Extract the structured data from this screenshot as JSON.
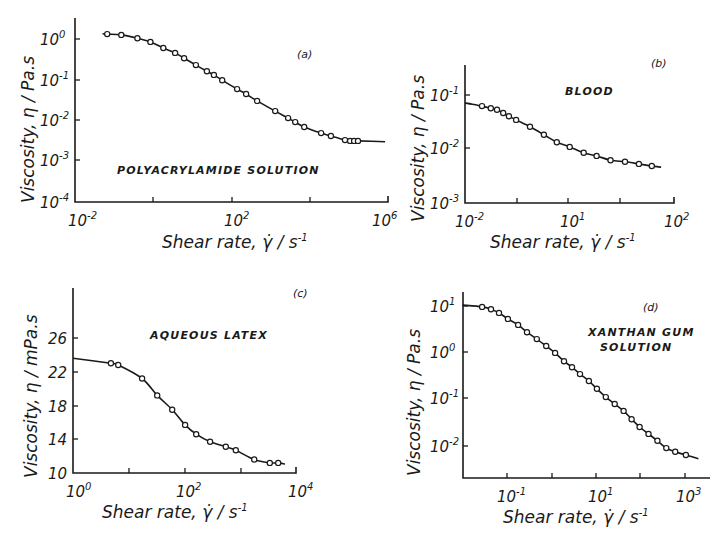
{
  "figure": {
    "panels": [
      {
        "id": "a",
        "tag": "(a)",
        "annotation": [
          "POLYACRYLAMIDE SOLUTION"
        ],
        "xlabel": "Shear rate, γ̇ / s⁻¹",
        "ylabel": "Viscosity, η / Pa.s"
      },
      {
        "id": "b",
        "tag": "(b)",
        "annotation": [
          "BLOOD"
        ],
        "xlabel": "Shear rate, γ̇ / s⁻¹",
        "ylabel": "Viscosity, η / Pa.s"
      },
      {
        "id": "c",
        "tag": "(c)",
        "annotation": [
          "AQUEOUS LATEX"
        ],
        "xlabel": "Shear rate, γ̇ / s⁻¹",
        "ylabel": "Viscosity, η / mPa.s"
      },
      {
        "id": "d",
        "tag": "(d)",
        "annotation": [
          "XANTHAN GUM",
          "SOLUTION"
        ],
        "xlabel": "Shear rate, γ̇ / s⁻¹",
        "ylabel": "Viscosity, η / Pa.s"
      }
    ]
  },
  "chart_data": [
    {
      "id": "a",
      "type": "line",
      "title": "(a) POLYACRYLAMIDE SOLUTION",
      "xlabel": "Shear rate, γ̇ / s⁻¹",
      "ylabel": "Viscosity, η / Pa.s",
      "xscale": "log",
      "yscale": "log",
      "xlim": [
        0.01,
        1000000
      ],
      "ylim": [
        0.0001,
        3
      ],
      "xticks": [
        "10^-2",
        "10^2",
        "10^6"
      ],
      "yticks": [
        "10^0",
        "10^-1",
        "10^-2",
        "10^-3",
        "10^-4"
      ],
      "x_log10": [
        -1.18,
        -0.82,
        -0.41,
        -0.08,
        0.25,
        0.55,
        0.78,
        1.08,
        1.36,
        1.54,
        1.75,
        2.13,
        2.36,
        2.64,
        3.1,
        3.43,
        3.61,
        3.84,
        4.27,
        4.52,
        4.88,
        5.01,
        5.11,
        5.21
      ],
      "y_log10": [
        0.12,
        0.1,
        0.02,
        -0.07,
        -0.22,
        -0.34,
        -0.47,
        -0.64,
        -0.79,
        -0.88,
        -1.01,
        -1.23,
        -1.35,
        -1.52,
        -1.77,
        -1.94,
        -2.04,
        -2.16,
        -2.31,
        -2.38,
        -2.48,
        -2.5,
        -2.5,
        -2.5
      ],
      "series": [
        {
          "name": "measured",
          "marker": "open-circle"
        },
        {
          "name": "fit",
          "style": "solid-line"
        }
      ]
    },
    {
      "id": "b",
      "type": "line",
      "title": "(b) BLOOD",
      "xlabel": "Shear rate, γ̇ / s⁻¹",
      "ylabel": "Viscosity, η / Pa.s",
      "xscale": "log",
      "yscale": "log",
      "xlim": [
        0.01,
        100
      ],
      "ylim": [
        0.001,
        0.3
      ],
      "xticks": [
        "10^-2",
        "10^1",
        "10^2"
      ],
      "yticks": [
        "10^-1",
        "10^-2",
        "10^-3"
      ],
      "x_log10": [
        -1.67,
        -1.5,
        -1.38,
        -1.26,
        -1.15,
        -1.01,
        -0.74,
        -0.47,
        -0.22,
        0.03,
        0.3,
        0.55,
        0.82,
        1.1,
        1.37,
        1.62
      ],
      "y_log10": [
        -1.21,
        -1.25,
        -1.28,
        -1.34,
        -1.4,
        -1.47,
        -1.6,
        -1.75,
        -1.89,
        -1.98,
        -2.09,
        -2.15,
        -2.23,
        -2.26,
        -2.3,
        -2.34
      ],
      "series": [
        {
          "name": "measured",
          "marker": "open-circle"
        },
        {
          "name": "fit",
          "style": "solid-line"
        }
      ]
    },
    {
      "id": "c",
      "type": "line",
      "title": "(c) AQUEOUS LATEX",
      "xlabel": "Shear rate, γ̇ / s⁻¹",
      "ylabel": "Viscosity, η / mPa.s",
      "xscale": "log",
      "yscale": "linear",
      "xlim": [
        1,
        10000
      ],
      "ylim": [
        10,
        30
      ],
      "xticks": [
        "10^0",
        "10^2",
        "10^4"
      ],
      "yticks": [
        "26",
        "22",
        "18",
        "14",
        "10"
      ],
      "x_log10": [
        0.68,
        0.81,
        1.24,
        1.51,
        1.78,
        2.01,
        2.21,
        2.46,
        2.74,
        2.92,
        3.25,
        3.53,
        3.68
      ],
      "y": [
        23.0,
        22.8,
        21.2,
        19.2,
        17.5,
        15.7,
        14.6,
        13.7,
        13.1,
        12.7,
        11.6,
        11.2,
        11.2
      ],
      "series": [
        {
          "name": "measured",
          "marker": "open-circle"
        },
        {
          "name": "fit",
          "style": "solid-line"
        }
      ]
    },
    {
      "id": "d",
      "type": "line",
      "title": "(d) XANTHAN GUM SOLUTION",
      "xlabel": "Shear rate, γ̇ / s⁻¹",
      "ylabel": "Viscosity, η / Pa.s",
      "xscale": "log",
      "yscale": "log",
      "xlim": [
        0.005,
        3000
      ],
      "ylim": [
        0.002,
        30
      ],
      "xticks": [
        "10^-1",
        "10^1",
        "10^3"
      ],
      "yticks": [
        "10^1",
        "10^0",
        "10^-1",
        "10^-2"
      ],
      "x_log10": [
        -1.56,
        -1.36,
        -1.18,
        -0.98,
        -0.75,
        -0.55,
        -0.33,
        -0.12,
        0.08,
        0.28,
        0.46,
        0.64,
        0.84,
        1.02,
        1.22,
        1.42,
        1.62,
        1.8,
        1.98,
        2.18,
        2.38,
        2.58,
        2.78,
        3.02
      ],
      "y_log10": [
        0.98,
        0.93,
        0.85,
        0.72,
        0.59,
        0.43,
        0.28,
        0.13,
        -0.02,
        -0.2,
        -0.33,
        -0.48,
        -0.63,
        -0.8,
        -0.98,
        -1.13,
        -1.28,
        -1.46,
        -1.63,
        -1.78,
        -1.93,
        -2.09,
        -2.17,
        -2.24
      ],
      "series": [
        {
          "name": "measured",
          "marker": "open-circle"
        },
        {
          "name": "fit",
          "style": "solid-line"
        }
      ]
    }
  ]
}
